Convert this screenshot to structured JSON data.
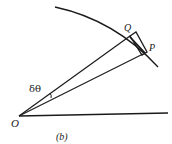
{
  "figure": {
    "caption": "(b)",
    "points": {
      "O": "O",
      "Q": "Q",
      "P": "P"
    },
    "angle_label": "δθ",
    "colors": {
      "stroke": "#1a1a1a",
      "background": "#ffffff"
    }
  }
}
